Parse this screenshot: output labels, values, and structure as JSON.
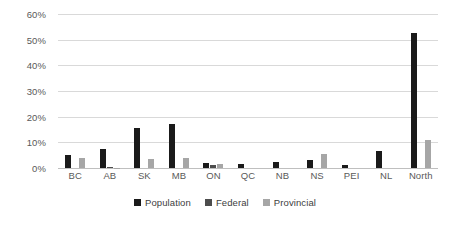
{
  "chart_data": {
    "type": "bar",
    "title": "",
    "subtitle": "",
    "xlabel": "",
    "ylabel": "",
    "ylim": [
      0,
      60
    ],
    "ytick_labels": [
      "0%",
      "10%",
      "20%",
      "30%",
      "40%",
      "50%",
      "60%"
    ],
    "ytick_values": [
      0,
      10,
      20,
      30,
      40,
      50,
      60
    ],
    "grid": true,
    "legend_position": "bottom-center",
    "categories": [
      "BC",
      "AB",
      "SK",
      "MB",
      "ON",
      "QC",
      "NB",
      "NS",
      "PEI",
      "NL",
      "North"
    ],
    "series": [
      {
        "name": "Population",
        "color": "#1a1a1a",
        "values": [
          5.0,
          7.5,
          15.5,
          17.0,
          2.0,
          1.5,
          2.5,
          3.0,
          1.0,
          6.5,
          52.5
        ]
      },
      {
        "name": "Federal",
        "color": "#4d4d4d",
        "values": [
          0,
          0.4,
          0,
          0,
          1.0,
          0,
          0,
          0,
          0,
          0,
          0
        ]
      },
      {
        "name": "Provincial",
        "color": "#a6a6a6",
        "values": [
          4.0,
          0.2,
          3.5,
          4.0,
          1.5,
          0,
          0,
          5.5,
          0,
          0,
          11.0
        ]
      }
    ]
  },
  "legend": {
    "items": [
      {
        "label": "Population"
      },
      {
        "label": "Federal"
      },
      {
        "label": "Provincial"
      }
    ]
  }
}
